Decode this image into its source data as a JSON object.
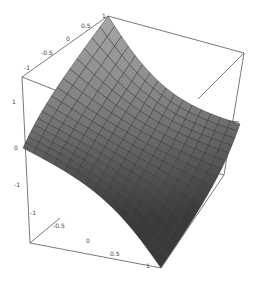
{
  "chart_data": {
    "type": "surface3d",
    "title": "",
    "xlabel": "",
    "ylabel": "",
    "zlabel": "",
    "x_ticks": [
      "-1",
      "-0.5",
      "0",
      "0.5",
      "1"
    ],
    "y_ticks": [
      "-1",
      "-0.5",
      "0",
      "0.5",
      "1"
    ],
    "z_ticks": [
      "1",
      "0",
      "-1"
    ],
    "xlim": [
      -1,
      1
    ],
    "ylim": [
      -1,
      1
    ],
    "zlim": [
      -1,
      1
    ],
    "grid_lines": 16,
    "shading": "gray",
    "corner_values": {
      "back": 1,
      "left": 0,
      "right": 0,
      "front": -1
    },
    "box": true
  },
  "colors": {
    "surface_light": "#a8a8a8",
    "surface_dark": "#3a3a3a",
    "mesh": "#2a2a2a",
    "box": "#6a6a6a",
    "background": "#ffffff"
  }
}
